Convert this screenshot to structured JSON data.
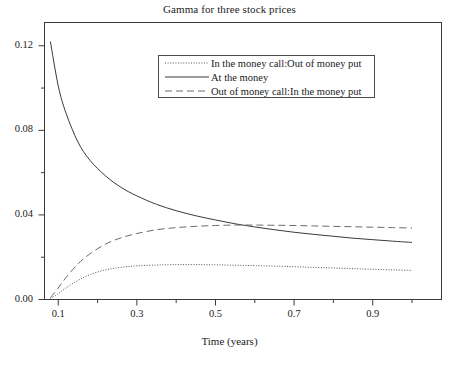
{
  "chart_data": {
    "type": "line",
    "title": "Gamma for three stock prices",
    "xlabel": "Time (years)",
    "ylabel": "",
    "xlim": [
      0.065,
      1.075
    ],
    "ylim": [
      0.0,
      0.131
    ],
    "grid": false,
    "legend_position": "upper center",
    "x_ticks_major": [
      0.1,
      0.3,
      0.5,
      0.7,
      0.9
    ],
    "x_ticks_major_labels": [
      "0.1",
      "0.3",
      "0.5",
      "0.7",
      "0.9"
    ],
    "x_ticks_minor": [
      0.2,
      0.4,
      0.6,
      0.8,
      1.0
    ],
    "y_ticks_major": [
      0.0,
      0.04,
      0.08,
      0.12
    ],
    "y_ticks_major_labels": [
      "0.00",
      "0.04",
      "0.08",
      "0.12"
    ],
    "y_ticks_minor": [
      0.02,
      0.06,
      0.1
    ],
    "x": [
      0.08,
      0.1,
      0.12,
      0.15,
      0.18,
      0.22,
      0.26,
      0.3,
      0.35,
      0.4,
      0.45,
      0.5,
      0.55,
      0.6,
      0.65,
      0.7,
      0.75,
      0.8,
      0.85,
      0.9,
      0.95,
      1.0
    ],
    "series": [
      {
        "name": "In the money call:Out of money put",
        "style": "dotted",
        "color": "#555555",
        "values": [
          0.0005,
          0.0028,
          0.0055,
          0.009,
          0.0117,
          0.014,
          0.0152,
          0.0159,
          0.0163,
          0.0165,
          0.0165,
          0.0164,
          0.0162,
          0.016,
          0.0158,
          0.0155,
          0.0152,
          0.0149,
          0.0146,
          0.0143,
          0.014,
          0.0138
        ]
      },
      {
        "name": "At the money",
        "style": "solid",
        "color": "#3a3a3a",
        "values": [
          0.122,
          0.101,
          0.088,
          0.0745,
          0.066,
          0.0585,
          0.053,
          0.049,
          0.045,
          0.042,
          0.0396,
          0.0376,
          0.0358,
          0.0343,
          0.033,
          0.0318,
          0.0308,
          0.0299,
          0.029,
          0.0283,
          0.0276,
          0.027
        ]
      },
      {
        "name": "Out of money call:In the money put",
        "style": "dashed",
        "color": "#6a6a6a",
        "values": [
          0.0008,
          0.0055,
          0.0105,
          0.0168,
          0.0215,
          0.0262,
          0.0292,
          0.0312,
          0.033,
          0.034,
          0.0346,
          0.035,
          0.0352,
          0.0352,
          0.0351,
          0.035,
          0.0348,
          0.0346,
          0.0344,
          0.0342,
          0.034,
          0.0338
        ]
      }
    ]
  },
  "legend": {
    "entries": [
      {
        "label": "In the money call:Out of money put",
        "sample": "dotted-line-sample"
      },
      {
        "label": "At the money",
        "sample": "solid-line-sample"
      },
      {
        "label": "Out of money call:In the money put",
        "sample": "dashed-line-sample"
      }
    ]
  }
}
